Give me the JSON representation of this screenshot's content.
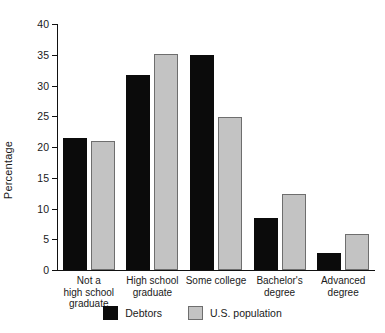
{
  "chart_data": {
    "type": "bar",
    "title": "",
    "subtitle": "",
    "xlabel": "",
    "ylabel": "Percentage",
    "ylim": [
      0,
      40
    ],
    "yticks": [
      0,
      5,
      10,
      15,
      20,
      25,
      30,
      35,
      40
    ],
    "ytick_labels": [
      "0",
      "5",
      "10",
      "15",
      "20",
      "25",
      "30",
      "35",
      "40"
    ],
    "grid": false,
    "legend_position": "bottom-center",
    "categories": [
      "Not a\nhigh school\ngraduate",
      "High school\ngraduate",
      "Some college",
      "Bachelor's\ndegree",
      "Advanced\ndegree"
    ],
    "category_lines": [
      [
        "Not a",
        "high school",
        "graduate"
      ],
      [
        "High school",
        "graduate"
      ],
      [
        "Some college"
      ],
      [
        "Bachelor's",
        "degree"
      ],
      [
        "Advanced",
        "degree"
      ]
    ],
    "series": [
      {
        "name": "Debtors",
        "color": "#0b0b0b",
        "values": [
          21.5,
          31.7,
          35.0,
          8.5,
          2.7
        ]
      },
      {
        "name": "U.S. population",
        "color": "#c3c3c3",
        "values": [
          20.9,
          35.1,
          24.9,
          12.4,
          5.8
        ]
      }
    ]
  },
  "legend": {
    "entries": [
      {
        "label": "Debtors",
        "swatch": "black-square-swatch"
      },
      {
        "label": "U.S. population",
        "swatch": "gray-square-swatch"
      }
    ]
  },
  "axes": {
    "y_title": "Percentage"
  }
}
